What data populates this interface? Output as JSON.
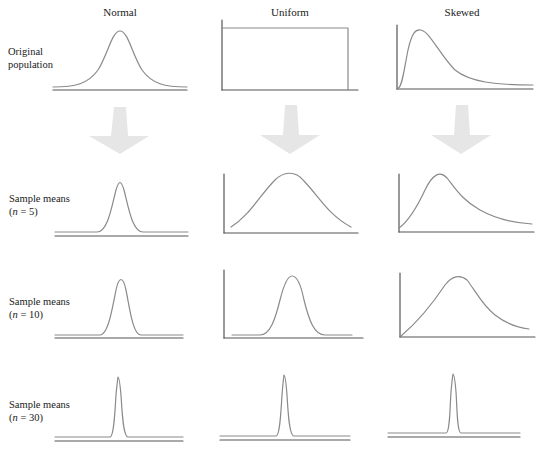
{
  "columns": [
    {
      "id": "normal",
      "title": "Normal"
    },
    {
      "id": "uniform",
      "title": "Uniform"
    },
    {
      "id": "skewed",
      "title": "Skewed"
    }
  ],
  "rows": [
    {
      "id": "original",
      "label_line1": "Original",
      "label_line2": "population"
    },
    {
      "id": "n5",
      "label_line1": "Sample means",
      "label_line2_prefix": "(",
      "label_n": "n",
      "label_line2_suffix": " = 5)"
    },
    {
      "id": "n10",
      "label_line1": "Sample means",
      "label_line2_prefix": "(",
      "label_n": "n",
      "label_line2_suffix": " = 10)"
    },
    {
      "id": "n30",
      "label_line1": "Sample means",
      "label_line2_prefix": "(",
      "label_n": "n",
      "label_line2_suffix": " = 30)"
    }
  ],
  "colors": {
    "curve": "#8a8a8a",
    "axis": "#555555",
    "arrow": "#e6e6e6",
    "text": "#1a1a1a"
  },
  "arrows": [
    {
      "column": "normal",
      "icon": "down-arrow-icon"
    },
    {
      "column": "uniform",
      "icon": "down-arrow-icon"
    },
    {
      "column": "skewed",
      "icon": "down-arrow-icon"
    }
  ]
}
